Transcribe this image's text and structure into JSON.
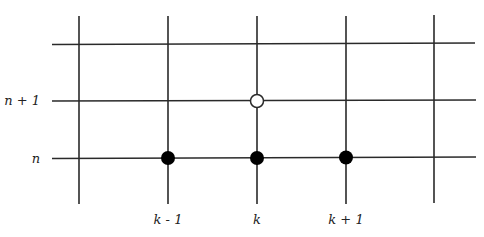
{
  "diagram": {
    "title": "",
    "type": "finite-difference stencil grid",
    "row_labels": {
      "n_plus_1": "n + 1",
      "n": "n"
    },
    "column_labels": {
      "k_minus_1": "k - 1",
      "k": "k",
      "k_plus_1": "k + 1"
    },
    "grid": {
      "vertical_lines_x": [
        79,
        168,
        257,
        346,
        434
      ],
      "horizontal_lines_y": [
        44,
        101,
        158
      ],
      "line_color": "#2a2a2a"
    },
    "nodes": [
      {
        "name": "node-n-k-minus-1",
        "row": "n",
        "col": "k - 1",
        "filled": true
      },
      {
        "name": "node-n-k",
        "row": "n",
        "col": "k",
        "filled": true
      },
      {
        "name": "node-n-k-plus-1",
        "row": "n",
        "col": "k + 1",
        "filled": true
      },
      {
        "name": "node-n-plus-1-k",
        "row": "n + 1",
        "col": "k",
        "filled": false
      }
    ],
    "colors": {
      "filled_node": "#000000",
      "open_node_fill": "#ffffff",
      "open_node_stroke": "#2a2a2a"
    }
  }
}
